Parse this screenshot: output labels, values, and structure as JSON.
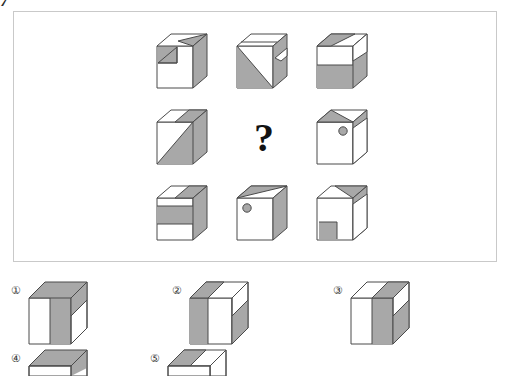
{
  "page": {
    "corner_mark": "7",
    "background_color": "#ffffff",
    "panel_border_color": "#c9c9c9",
    "gray_fill": "#a8a8a8",
    "line_color": "#4a4a4a"
  },
  "puzzle": {
    "type": "visual-reasoning-matrix",
    "rows": 3,
    "columns": 3,
    "missing_cell": {
      "row": 2,
      "column": 2,
      "marker": "?"
    },
    "cells": [
      {
        "position": "r1c1",
        "description": "Cube: white front face with gray square in upper-left, top face white with gray right triangle, right face gray"
      },
      {
        "position": "r1c2",
        "description": "Cube: front face with gray lower-left triangle, top face white with gray band, right face gray with white diagonal stripe"
      },
      {
        "position": "r1c3",
        "description": "Cube: front face white upper half and gray lower half, top face white with gray diagonal stripe, right face white over gray"
      },
      {
        "position": "r2c1",
        "description": "Cube: front face split by diagonal with gray lower-right triangle, top face white with gray right stripe, right face gray"
      },
      {
        "position": "r2c2",
        "description": "Missing cell marked with a question mark"
      },
      {
        "position": "r2c3",
        "description": "Cube: white front face with small gray circle near upper-right, top face gray peak triangle, right face white with gray upper triangle"
      },
      {
        "position": "r3c1",
        "description": "Cube: front face white band over gray band over white band, top face white with gray right stripe, right face gray"
      },
      {
        "position": "r3c2",
        "description": "Cube: white front face with small gray circle in upper-left, top face gray upper-left triangle, right face gray"
      },
      {
        "position": "r3c3",
        "description": "Cube: white front face with gray square in lower-left, top face gray peak triangle, right face white with gray upper triangle"
      }
    ]
  },
  "answer_options": [
    {
      "label": "①",
      "number": 1,
      "description": "Cube: front face white left half and gray right half, top face all gray, right face white with gray upper band"
    },
    {
      "label": "②",
      "number": 2,
      "description": "Cube: front face gray left band and white right, top face gray left stripe and white right, right face white upper and gray lower"
    },
    {
      "label": "③",
      "number": 3,
      "description": "Cube: front face white left and gray right, top face white left and gray right, right face white upper and gray lower"
    },
    {
      "label": "④",
      "number": 4,
      "description": "Cube partially cut off at bottom of page, only gray top face visible"
    },
    {
      "label": "⑤",
      "number": 5,
      "description": "Cube partially cut off at bottom of page, only gray and white top face visible"
    }
  ]
}
